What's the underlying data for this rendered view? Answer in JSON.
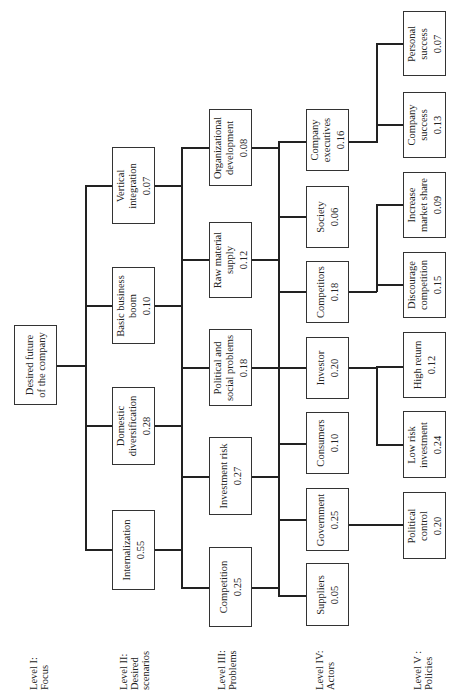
{
  "levels": [
    {
      "label": "Level I:\nFocus"
    },
    {
      "label": "Level II:\nDesired\nscenarios"
    },
    {
      "label": "Level III:\nProblems"
    },
    {
      "label": "Level IV:\nActors"
    },
    {
      "label": "Level V :\nPolicies"
    }
  ],
  "focus": {
    "label": "Desired future\nof the company"
  },
  "scenarios": [
    {
      "label": "Internalization",
      "value": "0.55"
    },
    {
      "label": "Domestic\ndiversification",
      "value": "0.28"
    },
    {
      "label": "Basic business\nboom",
      "value": "0.10"
    },
    {
      "label": "Vertical\nintegration",
      "value": "0.07"
    }
  ],
  "problems": [
    {
      "label": "Competition",
      "value": "0.25"
    },
    {
      "label": "Investment risk",
      "value": "0.27"
    },
    {
      "label": "Political and\nsocial problems",
      "value": "0.18"
    },
    {
      "label": "Raw material\nsupply",
      "value": "0.12"
    },
    {
      "label": "Organizational\ndevelopment",
      "value": "0.08"
    }
  ],
  "actors": [
    {
      "label": "Suppliers",
      "value": "0.05"
    },
    {
      "label": "Government",
      "value": "0.25"
    },
    {
      "label": "Consumers",
      "value": "0.10"
    },
    {
      "label": "Investor",
      "value": "0.20"
    },
    {
      "label": "Competitors",
      "value": "0.18"
    },
    {
      "label": "Society",
      "value": "0.06"
    },
    {
      "label": "Company\nexecutives",
      "value": "0.16"
    }
  ],
  "policies": [
    {
      "label": "Political\ncontrol",
      "value": "0.20"
    },
    {
      "label": "Low risk\ninvestment",
      "value": "0.24"
    },
    {
      "label": "High return",
      "value": "0.12"
    },
    {
      "label": "Discourage\ncompetition",
      "value": "0.15"
    },
    {
      "label": "Increase\nmarket share",
      "value": "0.09"
    },
    {
      "label": "Company\nsuccess",
      "value": "0.13"
    },
    {
      "label": "Personal\nsuccess",
      "value": "0.07"
    }
  ]
}
